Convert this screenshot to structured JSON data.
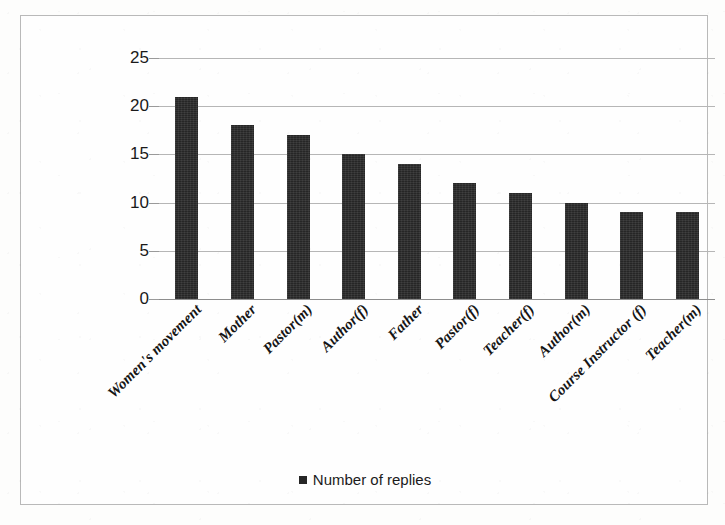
{
  "chart_data": {
    "type": "bar",
    "title": "",
    "subtitle": "",
    "xlabel": "",
    "ylabel": "",
    "ylim": [
      0,
      25
    ],
    "y_ticks": [
      0,
      5,
      10,
      15,
      20,
      25
    ],
    "grid": true,
    "legend_position": "bottom-center",
    "bar_color": "#262626",
    "categories": [
      "Women's movement",
      "Mother",
      "Pastor(m)",
      "Author(f)",
      "Father",
      "Pastor(f)",
      "Teacher(f)",
      "Author(m)",
      "Course Instructor (f)",
      "Teacher(m)"
    ],
    "series": [
      {
        "name": "Number of replies",
        "values": [
          21,
          18,
          17,
          15,
          14,
          12,
          11,
          10,
          9,
          9
        ]
      }
    ]
  },
  "legend": {
    "entries": [
      {
        "label": "Number of replies",
        "color": "#262626",
        "marker": "square-marker"
      }
    ]
  },
  "axes": {
    "y": {
      "tick_labels": [
        "25",
        "20",
        "15",
        "10",
        "5",
        "0"
      ]
    }
  }
}
